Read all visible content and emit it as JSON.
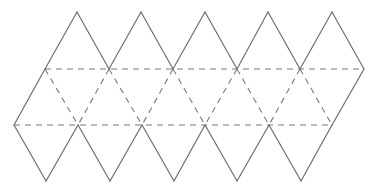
{
  "diagram": {
    "colors": {
      "background": "#ffffff",
      "cut_line": "#6e6e6e",
      "fold_line": "#7a7a7a"
    },
    "geometry": {
      "top_apex_y": 12,
      "upper_row_y": 69,
      "lower_row_y": 125,
      "bottom_apex_y": 181,
      "top_apex_x": [
        77,
        141,
        205,
        268,
        332
      ],
      "upper_row_x": [
        45,
        109,
        173,
        237,
        300,
        364
      ],
      "lower_row_x": [
        14,
        78,
        142,
        205,
        269,
        332
      ],
      "bottom_apex_x": [
        46,
        110,
        174,
        237,
        301
      ]
    },
    "line_types": {
      "solid": "cut edge",
      "dashed": "fold line"
    },
    "triangle_count": 20
  }
}
